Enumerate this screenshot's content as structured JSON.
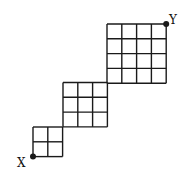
{
  "diagram": {
    "type": "grid-path",
    "stroke_color": "#1a1a1a",
    "background": "#ffffff",
    "cell_size": 14.8,
    "grids": [
      {
        "name": "small",
        "rows": 2,
        "cols": 2,
        "x": 33,
        "y": 127
      },
      {
        "name": "medium",
        "rows": 3,
        "cols": 3,
        "x": 63,
        "y": 82.5
      },
      {
        "name": "large",
        "rows": 4,
        "cols": 4,
        "x": 107,
        "y": 24
      }
    ],
    "points": {
      "start": {
        "label": "X",
        "x": 33,
        "y": 156.6
      },
      "end": {
        "label": "Y",
        "x": 166.2,
        "y": 24
      }
    }
  }
}
